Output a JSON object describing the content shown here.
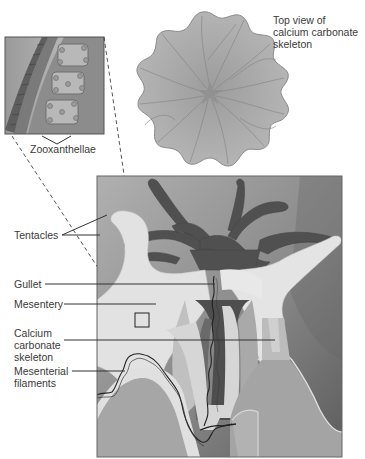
{
  "figure": {
    "labels": {
      "top_view": "Top view of\ncalcium carbonate\nskeleton",
      "zooxanthellae": "Zooxanthellae",
      "tentacles": "Tentacles",
      "gullet": "Gullet",
      "mesentery": "Mesentery",
      "calcium_skeleton": "Calcium\ncarbonate\nskeleton",
      "mesenterial_filaments": "Mesenterial\nfilaments"
    },
    "colors": {
      "background": "#ffffff",
      "box_light": "#a8a8a8",
      "box_dark": "#5a5a5a",
      "tissue_light": "#e4e4e4",
      "tissue_mid": "#b4b4b4",
      "tentacle_dark": "#4e4e4e",
      "skeleton_top": "#a9a9a9",
      "text": "#3a3a3a"
    }
  }
}
